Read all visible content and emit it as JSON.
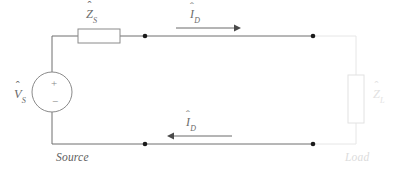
{
  "diagram": {
    "type": "electrical-circuit-schematic",
    "canvas": {
      "width": 400,
      "height": 175,
      "background": "#ffffff"
    },
    "colors": {
      "wire_dark": "#6f6f6f",
      "wire_faint": "#e6e6e6",
      "component_outline": "#8a8a8a",
      "component_outline_faint": "#e2e2e2",
      "node_dot": "#1a1a1a",
      "label_dark": "#6a6a6a",
      "label_faint": "#e0e0e0"
    }
  },
  "labels": {
    "source_impedance": {
      "symbol": "Z",
      "hat": "ˆ",
      "subscript": "S"
    },
    "source_voltage": {
      "symbol": "V",
      "hat": "ˆ",
      "subscript": "S"
    },
    "load_impedance": {
      "symbol": "Z",
      "hat": "ˆ",
      "subscript": "L"
    },
    "current_top": {
      "symbol": "I",
      "hat": "ˆ",
      "subscript": "D"
    },
    "current_bottom": {
      "symbol": "I",
      "hat": "ˆ",
      "subscript": "D"
    },
    "source_caption": "Source",
    "load_caption": "Load",
    "polarity_plus": "+",
    "polarity_minus": "−"
  },
  "components": {
    "source_impedance_box": {
      "x": 78,
      "y": 29,
      "width": 42,
      "height": 14
    },
    "load_impedance_box": {
      "x": 348,
      "y": 75,
      "width": 16,
      "height": 48
    },
    "voltage_source_circle": {
      "cx": 55,
      "cy": 92,
      "r": 20
    }
  },
  "wires": {
    "top_y": 36,
    "bottom_y": 144,
    "left_x": 52,
    "right_x": 356
  },
  "nodes": [
    {
      "name": "top-left-node",
      "x": 145,
      "y": 36
    },
    {
      "name": "top-right-node",
      "x": 313,
      "y": 36
    },
    {
      "name": "bottom-left-node",
      "x": 145,
      "y": 144
    },
    {
      "name": "bottom-right-node",
      "x": 313,
      "y": 144
    }
  ],
  "arrows": {
    "top": {
      "direction": "right",
      "x_start": 176,
      "x_end": 238,
      "y": 28
    },
    "bottom": {
      "direction": "left",
      "x_start": 232,
      "x_end": 170,
      "y": 136
    }
  }
}
